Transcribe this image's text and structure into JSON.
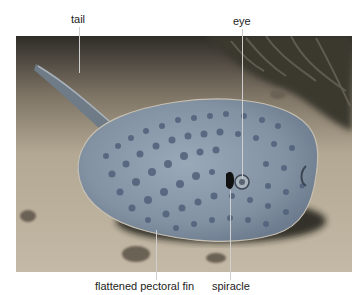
{
  "figure": {
    "labels": {
      "tail": "tail",
      "eye": "eye",
      "fin": "flattened pectoral fin",
      "spiracle": "spiracle"
    },
    "colors": {
      "sand": "#b9ad98",
      "sand_dark": "#8c8070",
      "shadow": "#2a2622",
      "body": "#7f8fa0",
      "body_light": "#97a6b5",
      "spots": "#4f5e74",
      "coral": "#3c3a33",
      "leader_line": "#d0d0d0"
    }
  }
}
